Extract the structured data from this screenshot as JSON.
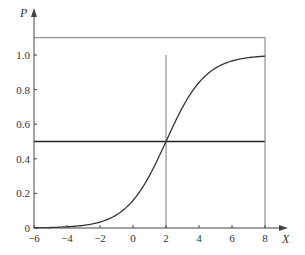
{
  "chart_data": {
    "type": "line",
    "title": "",
    "xlabel": "X",
    "ylabel": "P",
    "xlim": [
      -6,
      8
    ],
    "ylim": [
      0,
      1.1
    ],
    "grid": false,
    "legend": null,
    "x_ticks": [
      -6,
      -4,
      -2,
      0,
      2,
      4,
      6,
      8
    ],
    "x_tick_labels": [
      "−6",
      "−4",
      "−2",
      "0",
      "2",
      "4",
      "6",
      "8"
    ],
    "y_ticks": [
      0,
      0.2,
      0.4,
      0.6,
      0.8,
      1.0
    ],
    "y_tick_labels": [
      "0",
      "0.2",
      "0.4",
      "0.6",
      "0.8",
      "1.0"
    ],
    "series": [
      {
        "name": "logistic CDF",
        "x": [
          -6,
          -5,
          -4,
          -3,
          -2,
          -1,
          0,
          1,
          2,
          3,
          4,
          5,
          6,
          7,
          8
        ],
        "values": [
          0.001,
          0.003,
          0.007,
          0.015,
          0.034,
          0.076,
          0.159,
          0.303,
          0.5,
          0.697,
          0.841,
          0.924,
          0.966,
          0.985,
          0.993
        ]
      }
    ],
    "reference_lines": [
      {
        "orientation": "horizontal",
        "y": 0.5,
        "x_from": -6,
        "x_to": 8,
        "weight": "bold"
      },
      {
        "orientation": "horizontal",
        "y": 1.1,
        "x_from": -6,
        "x_to": 8,
        "weight": "thin"
      },
      {
        "orientation": "vertical",
        "x": 2,
        "y_from": 0,
        "y_to": 1.0,
        "weight": "thin"
      },
      {
        "orientation": "vertical",
        "x": 8,
        "y_from": 0,
        "y_to": 1.1,
        "weight": "thin"
      }
    ],
    "curve_params": {
      "location": 2,
      "scale": 1.2
    }
  },
  "colors": {
    "axis": "#444444",
    "curve": "#333333",
    "ref_bold": "#222222",
    "ref_thin": "#777777"
  }
}
